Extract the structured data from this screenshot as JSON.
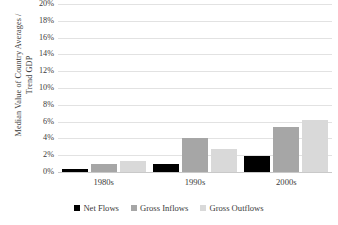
{
  "chart_data": {
    "type": "bar",
    "title": "",
    "xlabel": "",
    "ylabel": "Median Value of Country Averages /\nTrend GDP",
    "categories": [
      "1980s",
      "1990s",
      "2000s"
    ],
    "series": [
      {
        "name": "Net Flows",
        "color": "#000000",
        "values": [
          0.4,
          0.9,
          1.9
        ]
      },
      {
        "name": "Gross Inflows",
        "color": "#a6a6a6",
        "values": [
          0.9,
          4.0,
          5.3
        ]
      },
      {
        "name": "Gross Outflows",
        "color": "#d9d9d9",
        "values": [
          1.3,
          2.7,
          6.2
        ]
      }
    ],
    "ylim": [
      0,
      20
    ],
    "ytick_values": [
      20,
      18,
      16,
      14,
      12,
      10,
      8,
      6,
      4,
      2,
      0
    ],
    "ytick_labels": [
      "20%",
      "18%",
      "16%",
      "14%",
      "12%",
      "10%",
      "8%",
      "6%",
      "4%",
      "2%",
      "0%"
    ],
    "grid": true,
    "legend_position": "bottom"
  },
  "legend": {
    "items": [
      {
        "label": "Net Flows"
      },
      {
        "label": "Gross Inflows"
      },
      {
        "label": "Gross Outflows"
      }
    ]
  }
}
